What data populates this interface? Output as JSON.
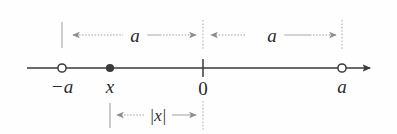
{
  "figure": {
    "background_color": "#fefefe",
    "axis_color": "#3a3a3a",
    "guide_color": "#b4b4b4",
    "arrow_color": "#8d8d8d",
    "text_color": "#2a2a2a"
  },
  "axis": {
    "line_y": 68,
    "x_start": 27,
    "x_end": 378,
    "arrow_direction": "right"
  },
  "points": [
    {
      "id": "neg-a",
      "label": "−a",
      "x": 62,
      "label_y": 86,
      "marker": "open-circle"
    },
    {
      "id": "x",
      "label": "x",
      "x": 110,
      "label_y": 86,
      "marker": "filled-dot"
    },
    {
      "id": "zero",
      "label": "0",
      "x": 203,
      "label_y": 88,
      "marker": "tick"
    },
    {
      "id": "a",
      "label": "a",
      "x": 342,
      "label_y": 86,
      "marker": "open-circle"
    }
  ],
  "top_measures": [
    {
      "id": "left-a",
      "label": "a",
      "from_x": 62,
      "to_x": 203,
      "label_x": 135,
      "label_y": 35,
      "arrows": "both-ends-inward"
    },
    {
      "id": "right-a",
      "label": "a",
      "from_x": 203,
      "to_x": 342,
      "label_x": 272,
      "label_y": 35,
      "arrows": "both-ends-inward"
    }
  ],
  "bottom_measure": {
    "id": "abs-x",
    "label": "|x|",
    "from_x": 110,
    "to_x": 203,
    "label_x": 158,
    "label_y": 115,
    "arrows": "both-ends-outward"
  },
  "guides": [
    {
      "id": "guide-neg-a",
      "x": 62,
      "y_top": 22,
      "y_bottom": 48,
      "style": "solid"
    },
    {
      "id": "guide-zero-top",
      "x": 203,
      "y_top": 22,
      "y_bottom": 48,
      "style": "dotted"
    },
    {
      "id": "guide-a",
      "x": 342,
      "y_top": 22,
      "y_bottom": 48,
      "style": "dotted"
    },
    {
      "id": "guide-x-bottom",
      "x": 110,
      "y_top": 103,
      "y_bottom": 128,
      "style": "solid"
    },
    {
      "id": "guide-zero-bottom",
      "x": 203,
      "y_top": 103,
      "y_bottom": 128,
      "style": "dotted"
    }
  ]
}
